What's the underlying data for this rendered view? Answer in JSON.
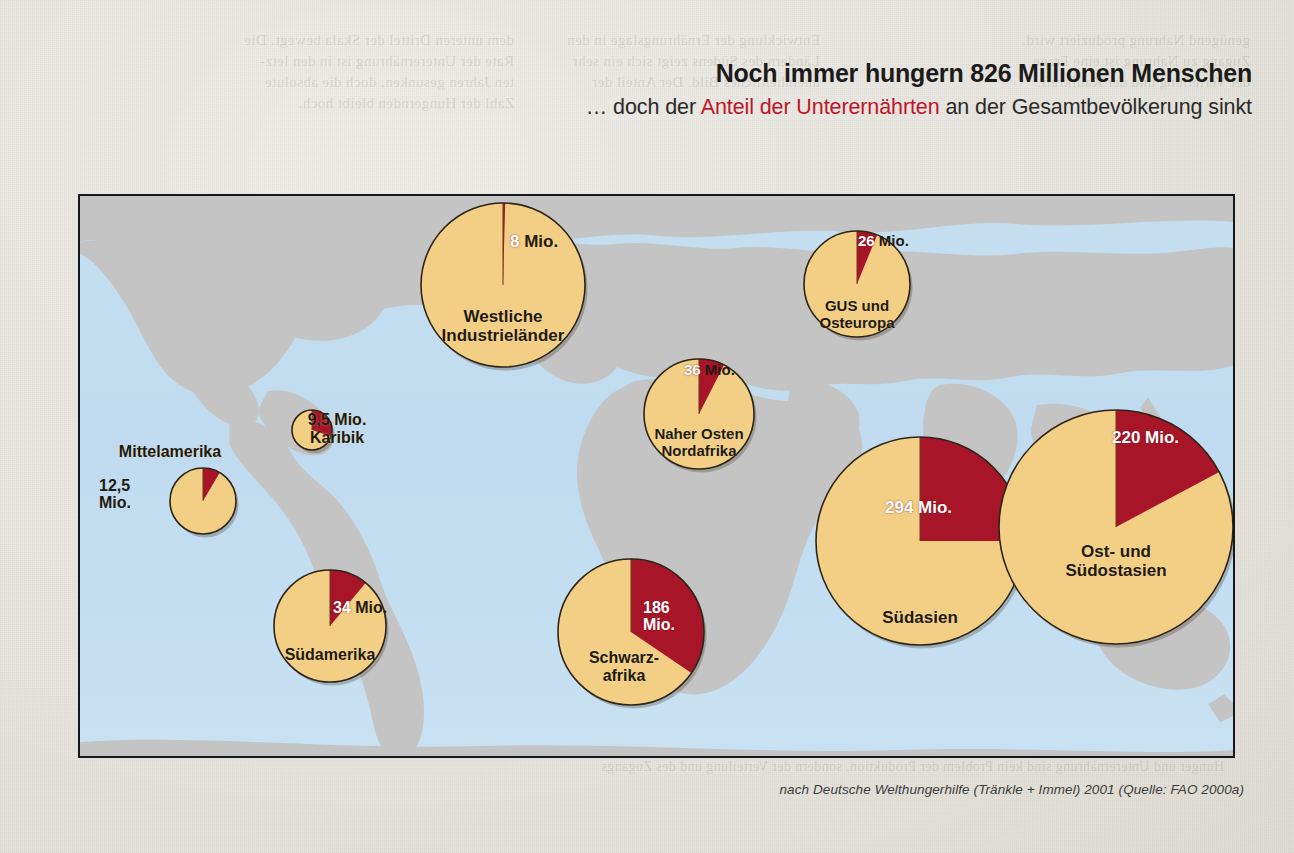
{
  "headline": {
    "main": "Noch immer hungern 826 Millionen Menschen",
    "sub_prefix": "… doch der ",
    "sub_accent": "Anteil der Unterernährten",
    "sub_suffix": " an der Gesamtbevölkerung sinkt",
    "accent_color": "#c0152a"
  },
  "source_note": "nach Deutsche Welthungerhilfe (Tränkle + Immel) 2001 (Quelle: FAO 2000a)",
  "bleed_text": {
    "top_left": "dem unteren Drittel der Skala bewegt. Die\nRate der Unterernährung ist in den letz-\nten Jahren gesunken, doch die absolute\nZahl der Hungernden bleibt hoch.",
    "top_mid": "Entwicklung der Ernährungslage in den\nLändern des Südens zeigt sich ein sehr\nuneinheitliches Bild. Der Anteil der",
    "top_right": "genügend Nahrung produziert wird.\nZugang zu Nahrung ist eine Frage\nder Verteilung und der Kaufkraft.",
    "mid_right": "Die Zahl der\nUnterernährten\nist in Asien am\nhöchsten",
    "bottom": "Hunger und Unterernährung sind kein Problem der Produktion, sondern der Verteilung und des Zugangs"
  },
  "map": {
    "ocean_color": "#c2dcef",
    "land_color": "#c4c4c4",
    "border_color": "#14171c"
  },
  "chart_data": {
    "type": "pie",
    "title": "Noch immer hungern 826 Millionen Menschen",
    "subtitle": "… doch der Anteil der Unterernährten an der Gesamtbevölkerung sinkt",
    "unit": "Mio.",
    "legend": [
      {
        "name": "Unterernährte",
        "color": "#a81528"
      },
      {
        "name": "Übrige Bevölkerung",
        "color": "#f3cf85"
      }
    ],
    "total_undernourished_millions": 826,
    "regions": [
      {
        "id": "westliche-industrielaender",
        "label": "Westliche\nIndustrieländer",
        "value_label": "8 Mio.",
        "undernourished_millions": 8,
        "red_fraction": 0.009,
        "cx": 501,
        "cy": 283,
        "r": 82,
        "label_x": 501,
        "label_y": 305,
        "label_size": 17,
        "value_x": 508,
        "value_y": 231,
        "value_size": 17,
        "value_align": "left",
        "value_color": "mixed",
        "value_white_part": "8",
        "value_rest": " Mio."
      },
      {
        "id": "gus-und-osteuropa",
        "label": "GUS und\nOsteuropa",
        "value_label": "26 Mio.",
        "undernourished_millions": 26,
        "red_fraction": 0.062,
        "cx": 855,
        "cy": 282,
        "r": 53,
        "label_x": 855,
        "label_y": 296,
        "label_size": 15,
        "value_x": 856,
        "value_y": 231,
        "value_size": 15,
        "value_align": "left",
        "value_color": "mixed",
        "value_white_part": "26",
        "value_rest": " Mio."
      },
      {
        "id": "naher-osten-nordafrika",
        "label": "Naher Osten\nNordafrika",
        "value_label": "36 Mio.",
        "undernourished_millions": 36,
        "red_fraction": 0.075,
        "cx": 697,
        "cy": 412,
        "r": 55,
        "label_x": 697,
        "label_y": 424,
        "label_size": 15,
        "value_x": 682,
        "value_y": 360,
        "value_size": 15,
        "value_align": "left",
        "value_color": "mixed",
        "value_white_part": "36",
        "value_rest": " Mio."
      },
      {
        "id": "mittelamerika",
        "label": "Mittelamerika",
        "value_label": "12,5\nMio.",
        "undernourished_millions": 12.5,
        "red_fraction": 0.085,
        "cx": 201,
        "cy": 499,
        "r": 33,
        "label_x": 168,
        "label_y": 441,
        "label_size": 16,
        "value_x": 97,
        "value_y": 475,
        "value_size": 16,
        "value_align": "left",
        "value_color": "dark",
        "value_white_part": "",
        "value_rest": "12,5\nMio."
      },
      {
        "id": "karibik",
        "label": "9,5 Mio.\nKaribik",
        "value_label": "9,5 Mio.",
        "undernourished_millions": 9.5,
        "red_fraction": 0.3,
        "cx": 310,
        "cy": 428,
        "r": 20,
        "label_x": 335,
        "label_y": 409,
        "label_size": 16,
        "value_x": 0,
        "value_y": 0,
        "value_size": 0,
        "value_align": "left",
        "value_color": "dark",
        "value_white_part": "",
        "value_rest": ""
      },
      {
        "id": "suedamerika",
        "label": "Südamerika",
        "value_label": "34 Mio.",
        "undernourished_millions": 34,
        "red_fraction": 0.11,
        "cx": 328,
        "cy": 624,
        "r": 56,
        "label_x": 328,
        "label_y": 644,
        "label_size": 16,
        "value_x": 331,
        "value_y": 597,
        "value_size": 16,
        "value_align": "left",
        "value_color": "mixed",
        "value_white_part": "34",
        "value_rest": " Mio."
      },
      {
        "id": "schwarzafrika",
        "label": "Schwarz-\nafrika",
        "value_label": "186\nMio.",
        "undernourished_millions": 186,
        "red_fraction": 0.345,
        "cx": 629,
        "cy": 630,
        "r": 73,
        "label_x": 622,
        "label_y": 647,
        "label_size": 16,
        "value_x": 641,
        "value_y": 597,
        "value_size": 16,
        "value_align": "left",
        "value_color": "white",
        "value_white_part": "186\nMio.",
        "value_rest": ""
      },
      {
        "id": "suedasien",
        "label": "Südasien",
        "value_label": "294 Mio.",
        "undernourished_millions": 294,
        "red_fraction": 0.25,
        "cx": 918,
        "cy": 539,
        "r": 104,
        "label_x": 918,
        "label_y": 606,
        "label_size": 17,
        "value_x": 883,
        "value_y": 497,
        "value_size": 17,
        "value_align": "left",
        "value_color": "white",
        "value_white_part": "294 Mio.",
        "value_rest": ""
      },
      {
        "id": "ost-und-suedostasien",
        "label": "Ost- und\nSüdostasien",
        "value_label": "220 Mio.",
        "undernourished_millions": 220,
        "red_fraction": 0.172,
        "cx": 1114,
        "cy": 525,
        "r": 117,
        "label_x": 1114,
        "label_y": 540,
        "label_size": 17,
        "value_x": 1110,
        "value_y": 427,
        "value_size": 17,
        "value_align": "left",
        "value_color": "white",
        "value_white_part": "220 Mio.",
        "value_rest": ""
      }
    ]
  }
}
